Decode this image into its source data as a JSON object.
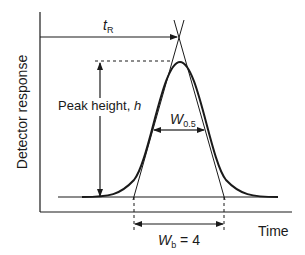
{
  "diagram": {
    "type": "chromatogram-peak",
    "y_axis_label": "Detector response",
    "x_axis_label": "Time",
    "retention_time": {
      "symbol": "t",
      "subscript": "R"
    },
    "peak_height": {
      "text": "Peak height, ",
      "symbol": "h"
    },
    "half_width": {
      "symbol": "W",
      "subscript": "0.5"
    },
    "base_width": {
      "symbol": "W",
      "subscript": "b",
      "value_text": " = 4"
    },
    "colors": {
      "line": "#1a1a1a",
      "background": "#ffffff"
    }
  }
}
